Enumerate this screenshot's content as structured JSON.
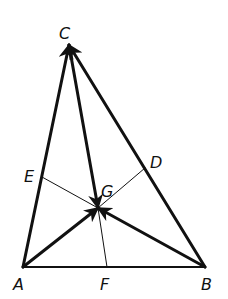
{
  "diagram": {
    "type": "triangle-medians-vectors",
    "colors": {
      "stroke": "#111111",
      "background": "#ffffff"
    },
    "points": {
      "A": {
        "label": "A",
        "x": 23,
        "y": 267,
        "lx": 13,
        "ly": 290
      },
      "B": {
        "label": "B",
        "x": 205,
        "y": 267,
        "lx": 201,
        "ly": 290
      },
      "C": {
        "label": "C",
        "x": 69,
        "y": 45,
        "lx": 59,
        "ly": 39
      },
      "D": {
        "label": "D",
        "x": 145,
        "y": 168,
        "lx": 150,
        "ly": 168
      },
      "E": {
        "label": "E",
        "x": 42,
        "y": 177,
        "lx": 24,
        "ly": 182
      },
      "F": {
        "label": "F",
        "x": 107,
        "y": 267,
        "lx": 100,
        "ly": 290
      },
      "G": {
        "label": "G",
        "x": 98,
        "y": 208,
        "lx": 101,
        "ly": 197
      }
    },
    "thick_segments": [
      "A-C",
      "C-B",
      "A-B"
    ],
    "thin_segments": [
      "E-G",
      "G-D",
      "G-F"
    ],
    "vectors": [
      "A->C",
      "B->C",
      "C->G",
      "A->G",
      "B->G"
    ]
  }
}
